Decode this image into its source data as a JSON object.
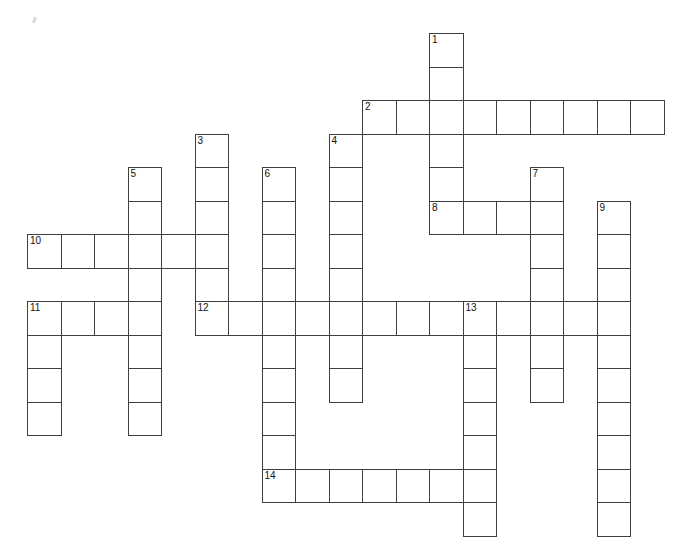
{
  "puzzle": {
    "title": "Crossword Puzzle Grid",
    "cell_size": 33.5,
    "origin_x": 27,
    "origin_y": 33,
    "grid_cols": 20,
    "grid_rows": 16,
    "border_color": "#3f3f3f",
    "cell_fill": "#ffffff",
    "number_color": "#111111",
    "entries": [
      {
        "number": "1",
        "direction": "down",
        "col": 12,
        "row": 0,
        "length": 6,
        "letters": ""
      },
      {
        "number": "2",
        "direction": "across",
        "col": 10,
        "row": 2,
        "length": 9,
        "letters": ""
      },
      {
        "number": "3",
        "direction": "down",
        "col": 5,
        "row": 3,
        "length": 6,
        "letters": ""
      },
      {
        "number": "4",
        "direction": "down",
        "col": 9,
        "row": 3,
        "length": 8,
        "letters": ""
      },
      {
        "number": "5",
        "direction": "down",
        "col": 3,
        "row": 4,
        "length": 8,
        "letters": ""
      },
      {
        "number": "6",
        "direction": "down",
        "col": 7,
        "row": 4,
        "length": 9,
        "letters": ""
      },
      {
        "number": "7",
        "direction": "down",
        "col": 15,
        "row": 4,
        "length": 7,
        "letters": ""
      },
      {
        "number": "8",
        "direction": "across",
        "col": 12,
        "row": 5,
        "length": 4,
        "letters": ""
      },
      {
        "number": "9",
        "direction": "down",
        "col": 17,
        "row": 5,
        "length": 10,
        "letters": ""
      },
      {
        "number": "10",
        "direction": "across",
        "col": 0,
        "row": 6,
        "length": 6,
        "letters": ""
      },
      {
        "number": "11",
        "direction": "across",
        "col": 0,
        "row": 8,
        "length": 4,
        "letters": ""
      },
      {
        "number": "11",
        "direction": "down",
        "col": 0,
        "row": 8,
        "length": 4,
        "letters": ""
      },
      {
        "number": "12",
        "direction": "across",
        "col": 5,
        "row": 8,
        "length": 13,
        "letters": ""
      },
      {
        "number": "13",
        "direction": "down",
        "col": 13,
        "row": 8,
        "length": 7,
        "letters": ""
      },
      {
        "number": "14",
        "direction": "across",
        "col": 7,
        "row": 13,
        "length": 7,
        "letters": ""
      }
    ]
  }
}
